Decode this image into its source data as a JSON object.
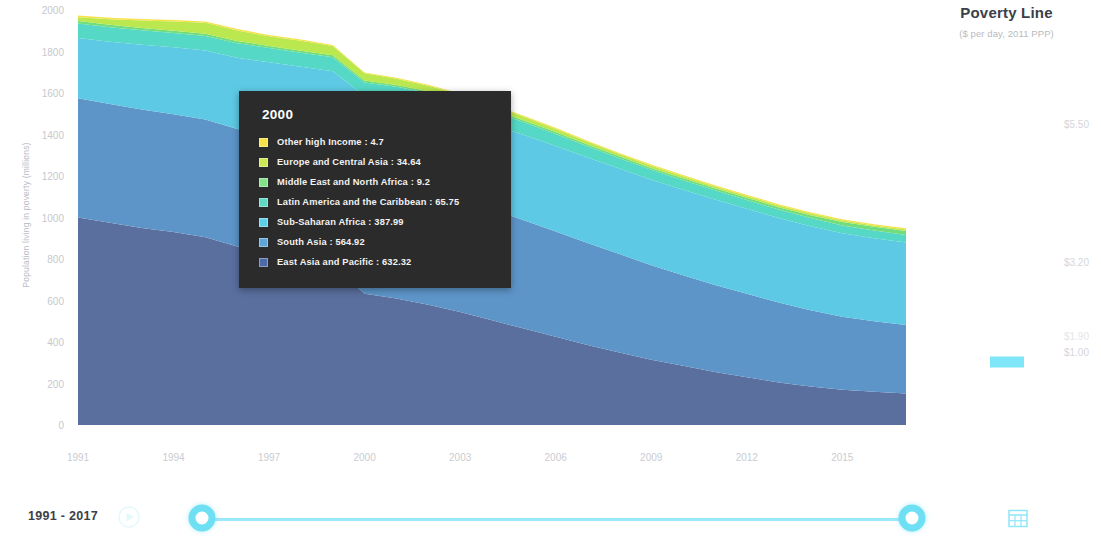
{
  "chart_data": {
    "type": "area",
    "stacked": true,
    "title": "",
    "xlabel": "",
    "ylabel": "Population living in poverty (millions)",
    "ylim": [
      0,
      2000
    ],
    "y_ticks": [
      2000,
      1800,
      1600,
      1400,
      1200,
      1000,
      800,
      600,
      400,
      200,
      0
    ],
    "x_ticks": [
      1991,
      1994,
      1997,
      2000,
      2003,
      2006,
      2009,
      2012,
      2015
    ],
    "xlim": [
      1991,
      2017
    ],
    "grid": false,
    "legend_position": "right",
    "x": [
      1991,
      1992,
      1993,
      1994,
      1995,
      1996,
      1997,
      1998,
      1999,
      2000,
      2001,
      2002,
      2003,
      2004,
      2005,
      2006,
      2007,
      2008,
      2009,
      2010,
      2011,
      2012,
      2013,
      2014,
      2015,
      2016,
      2017
    ],
    "series": [
      {
        "name": "East Asia and Pacific",
        "color": "#5a6f9e",
        "values": [
          1000,
          975,
          950,
          930,
          905,
          860,
          830,
          800,
          770,
          632,
          610,
          580,
          545,
          505,
          465,
          425,
          385,
          350,
          315,
          285,
          255,
          230,
          205,
          185,
          170,
          160,
          152
        ]
      },
      {
        "name": "South Asia",
        "color": "#5d95c9",
        "values": [
          575,
          572,
          570,
          568,
          567,
          566,
          566,
          565,
          565,
          565,
          560,
          552,
          545,
          535,
          522,
          508,
          492,
          474,
          455,
          437,
          420,
          402,
          385,
          368,
          352,
          340,
          330
        ]
      },
      {
        "name": "Sub-Saharan Africa",
        "color": "#5ec9e4",
        "values": [
          290,
          300,
          312,
          322,
          333,
          344,
          352,
          361,
          370,
          388,
          394,
          400,
          404,
          407,
          410,
          412,
          412,
          412,
          412,
          412,
          412,
          410,
          408,
          405,
          402,
          400,
          398
        ]
      },
      {
        "name": "Latin America and the Caribbean",
        "color": "#55d8c6",
        "values": [
          70,
          70,
          70,
          69,
          70,
          70,
          69,
          68,
          67,
          65.75,
          66,
          68,
          68,
          66,
          62,
          58,
          54,
          50,
          48,
          46,
          44,
          42,
          40,
          39,
          38,
          37,
          36
        ]
      },
      {
        "name": "Middle East and North Africa",
        "color": "#72dd7c",
        "values": [
          12,
          12,
          11,
          11,
          11,
          11,
          10,
          10,
          10,
          9.2,
          9,
          9,
          9,
          9,
          9,
          9,
          9,
          9,
          9,
          9,
          10,
          11,
          12,
          14,
          16,
          18,
          19
        ]
      },
      {
        "name": "Europe and Central Asia",
        "color": "#bbe84f",
        "values": [
          18,
          26,
          36,
          45,
          52,
          50,
          46,
          48,
          44,
          34.64,
          30,
          26,
          22,
          19,
          17,
          15,
          13,
          11,
          11,
          10,
          9,
          9,
          8,
          8,
          7,
          7,
          7
        ]
      },
      {
        "name": "Other high Income",
        "color": "#f5e24b",
        "values": [
          8,
          8,
          8,
          7,
          7,
          7,
          7,
          6,
          5,
          4.7,
          5,
          5,
          5,
          5,
          5,
          5,
          5,
          5,
          6,
          6,
          6,
          6,
          6,
          6,
          6,
          6,
          6
        ]
      }
    ],
    "tooltip": {
      "year": "2000",
      "rows": [
        {
          "label": "Other high Income : 4.7",
          "color": "#f5e24b"
        },
        {
          "label": "Europe and Central Asia : 34.64",
          "color": "#cbe857"
        },
        {
          "label": "Middle East and North Africa : 9.2",
          "color": "#85e08a"
        },
        {
          "label": "Latin America and the Caribbean : 65.75",
          "color": "#62d8c4"
        },
        {
          "label": "Sub-Saharan Africa : 387.99",
          "color": "#5ecfe6"
        },
        {
          "label": "South Asia : 564.92",
          "color": "#5fa6d8"
        },
        {
          "label": "East Asia and Pacific : 632.32",
          "color": "#4f6aa8"
        }
      ]
    }
  },
  "legend": {
    "title": "Poverty Line",
    "subtitle": "($ per day, 2011 PPP)",
    "items": [
      {
        "label": "$5.50",
        "selected": false,
        "faint": false
      },
      {
        "label": "$3.20",
        "selected": false,
        "faint": false
      },
      {
        "label": "$1.90",
        "selected": false,
        "faint": true
      },
      {
        "label": "$1.00",
        "selected": true,
        "faint": false
      }
    ]
  },
  "timebar": {
    "range_label": "1991 - 2017",
    "play_icon": "play-icon",
    "calendar_icon": "calendar-icon",
    "handle_left_value": "1991",
    "handle_right_value": "2017"
  }
}
